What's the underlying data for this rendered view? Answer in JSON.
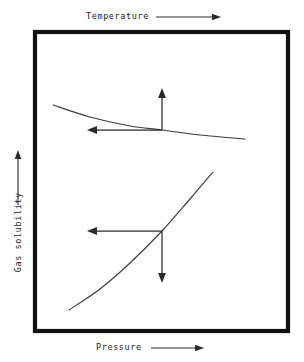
{
  "figure": {
    "type": "schematic-diagram",
    "title_visible": false,
    "background_color": "#ffffff",
    "frame": {
      "stroke_color": "#111111",
      "x": 35,
      "y": 32,
      "width": 253,
      "height": 299
    }
  },
  "axes": {
    "top": {
      "label": "Temperature",
      "arrow_direction": "right",
      "arrow_label": "increasing"
    },
    "bottom": {
      "label": "Pressure",
      "arrow_direction": "right",
      "arrow_label": "increasing"
    },
    "left": {
      "label": "Gas solubility",
      "arrow_direction": "up",
      "arrow_label": "increasing",
      "rotation_deg": -90
    }
  },
  "chart_data": {
    "type": "line",
    "xlabel": "Pressure",
    "ylabel": "Gas solubility",
    "secondary_xlabel": "Temperature",
    "grid": false,
    "legend": "none",
    "series": [
      {
        "name": "Solubility vs Temperature",
        "trend": "decreasing",
        "curvature": "slightly concave up",
        "points": [
          [
            53,
            105
          ],
          [
            90,
            117
          ],
          [
            130,
            126
          ],
          [
            162,
            130
          ],
          [
            200,
            135
          ],
          [
            245,
            139
          ]
        ]
      },
      {
        "name": "Solubility vs Pressure",
        "trend": "increasing",
        "curvature": "gently s-shaped",
        "points": [
          [
            69,
            310
          ],
          [
            100,
            289
          ],
          [
            130,
            263
          ],
          [
            162,
            231
          ],
          [
            190,
            199
          ],
          [
            213,
            172
          ]
        ]
      }
    ],
    "annotations": [
      {
        "name": "temperature-up-arrow",
        "attached_to": "Solubility vs Temperature",
        "direction": "up",
        "from": [
          162,
          130
        ],
        "to": [
          162,
          88
        ]
      },
      {
        "name": "temperature-left-arrow",
        "attached_to": "Solubility vs Temperature",
        "direction": "left",
        "from": [
          162,
          130
        ],
        "to": [
          87,
          130
        ]
      },
      {
        "name": "pressure-left-arrow",
        "attached_to": "Solubility vs Pressure",
        "direction": "left",
        "from": [
          162,
          231
        ],
        "to": [
          87,
          231
        ]
      },
      {
        "name": "pressure-down-arrow",
        "attached_to": "Solubility vs Pressure",
        "direction": "down",
        "from": [
          162,
          231
        ],
        "to": [
          162,
          283
        ]
      }
    ]
  }
}
